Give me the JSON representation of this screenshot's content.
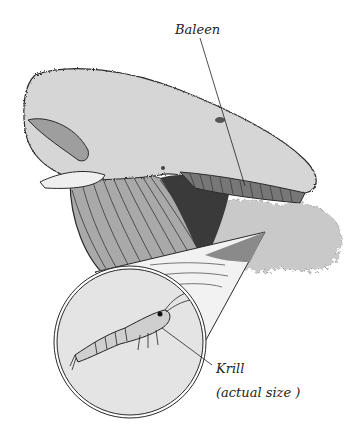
{
  "figure": {
    "labels": {
      "baleen": "Baleen",
      "krill": "Krill",
      "krill_note": "(actual size )"
    },
    "colors": {
      "background": "#ffffff",
      "whale_body": "#d4d4d4",
      "whale_dark": "#8a8a8a",
      "mouth_interior": "#3a3a3a",
      "krill_cloud": "#c8c8c8",
      "inset_fill": "#e6e6e6",
      "outline": "#2a2a2a"
    }
  }
}
